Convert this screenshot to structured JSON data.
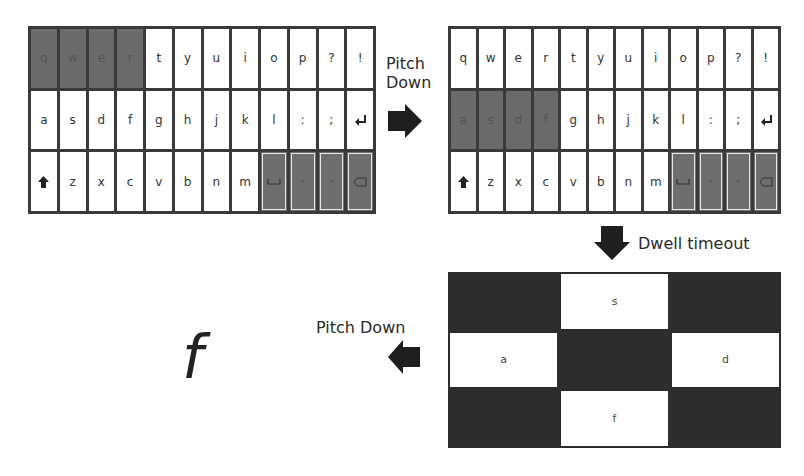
{
  "panels": {
    "keyboard1": {
      "rows": [
        [
          "q",
          "w",
          "e",
          "r",
          "t",
          "y",
          "u",
          "i",
          "o",
          "p",
          "?",
          "!"
        ],
        [
          "a",
          "s",
          "d",
          "f",
          "g",
          "h",
          "j",
          "k",
          "l",
          ":",
          ";",
          "enter-icon"
        ],
        [
          "shift-icon",
          "z",
          "x",
          "c",
          "v",
          "b",
          "n",
          "m",
          "space-icon",
          "·",
          "·",
          "delete-icon"
        ]
      ],
      "highlighted_group": [
        "q",
        "w",
        "e",
        "r"
      ]
    },
    "keyboard2": {
      "rows": [
        [
          "q",
          "w",
          "e",
          "r",
          "t",
          "y",
          "u",
          "i",
          "o",
          "p",
          "?",
          "!"
        ],
        [
          "a",
          "s",
          "d",
          "f",
          "g",
          "h",
          "j",
          "k",
          "l",
          ":",
          ";",
          "enter-icon"
        ],
        [
          "shift-icon",
          "z",
          "x",
          "c",
          "v",
          "b",
          "n",
          "m",
          "space-icon",
          "·",
          "·",
          "delete-icon"
        ]
      ],
      "highlighted_group": [
        "a",
        "s",
        "d",
        "f"
      ]
    },
    "selection_grid": {
      "top": "s",
      "left": "a",
      "right": "d",
      "bottom": "f"
    },
    "result": "f"
  },
  "transitions": {
    "t1": "Pitch\nDown",
    "t1_line1": "Pitch",
    "t1_line2": "Down",
    "t2": "Dwell timeout",
    "t3": "Pitch Down"
  },
  "colors": {
    "highlight": "#6b6b6b",
    "border": "#3a3a3a",
    "grid_dark": "#2c2c2c",
    "key_bg": "#ffffff"
  }
}
